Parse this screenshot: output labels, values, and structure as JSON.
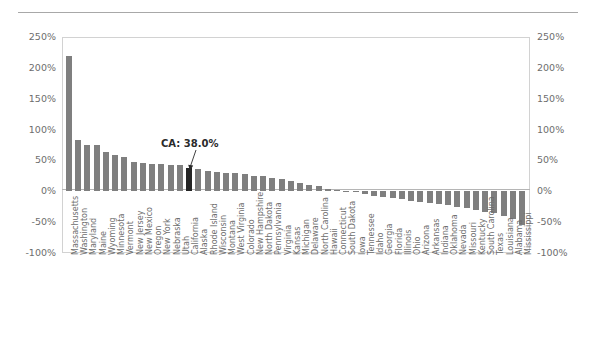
{
  "chart_data": {
    "type": "bar",
    "title": "",
    "subtitle": "",
    "xlabel": "",
    "ylabel": "",
    "ylim": [
      -100,
      250
    ],
    "ytick_labels": [
      "250%",
      "200%",
      "150%",
      "100%",
      "50%",
      "0%",
      "-50%",
      "-100%"
    ],
    "ytick_values": [
      250,
      200,
      150,
      100,
      50,
      0,
      -50,
      -100
    ],
    "grid": false,
    "legend": "none",
    "axis_right_mirrored": true,
    "bar_color": "#7f7f7f",
    "highlight_color": "#252525",
    "highlight_category": "California",
    "annotations": [
      {
        "text": "CA: 38.0%",
        "target_category": "California",
        "target_value": 38.0
      }
    ],
    "categories": [
      "Massachusetts",
      "Washington",
      "Maryland",
      "Maine",
      "Wyoming",
      "Minnesota",
      "Vermont",
      "New Jersey",
      "New Mexico",
      "Oregon",
      "New York",
      "Nebraska",
      "Utah",
      "California",
      "Alaska",
      "Rhode Island",
      "Wisconsin",
      "Montana",
      "West Virginia",
      "Colorado",
      "New Hampshire",
      "North Dakota",
      "Pennsylvania",
      "Virginia",
      "Kansas",
      "Michigan",
      "Delaware",
      "North Carolina",
      "Hawaii",
      "Connecticut",
      "South Dakota",
      "Iowa",
      "Tennessee",
      "Idaho",
      "Georgia",
      "Florida",
      "Illinois",
      "Ohio",
      "Arizona",
      "Arkansas",
      "Indiana",
      "Oklahoma",
      "Nevada",
      "Missouri",
      "Kentucky",
      "South Carolina",
      "Texas",
      "Louisiana",
      "Alabama",
      "Mississippi"
    ],
    "values": [
      220,
      83,
      75,
      75,
      63,
      58,
      56,
      48,
      46,
      45,
      44,
      43,
      42,
      38,
      36,
      33,
      32,
      30,
      29,
      28,
      25,
      24,
      22,
      20,
      16,
      13,
      10,
      8,
      4,
      2,
      1,
      0,
      -4,
      -7,
      -9,
      -11,
      -13,
      -15,
      -17,
      -19,
      -21,
      -23,
      -25,
      -27,
      -30,
      -33,
      -36,
      -40,
      -45,
      -55
    ]
  }
}
